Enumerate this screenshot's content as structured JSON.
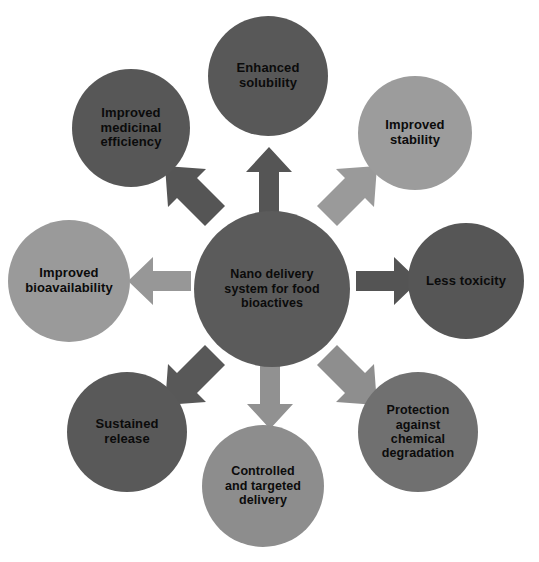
{
  "diagram": {
    "type": "radial-hub-and-spoke",
    "background_color": "#ffffff",
    "palette": {
      "dark_gray": "#5b5b5b",
      "mid_dark_gray": "#606060",
      "light_gray": "#9b9b9b",
      "text_color": "#0b0b0b"
    },
    "center": {
      "label": "Nano delivery\nsystem for food\nbioactives",
      "color": "#5b5b5b",
      "font_size": "12.5px",
      "cx": 272,
      "cy": 289,
      "r": 78
    },
    "nodes": [
      {
        "id": "enhanced-solubility",
        "label": "Enhanced\nsolubility",
        "color": "#585858",
        "cx": 268,
        "cy": 76,
        "r": 60,
        "font_size": "13px",
        "position": "top"
      },
      {
        "id": "improved-stability",
        "label": "Improved\nstability",
        "color": "#9c9c9c",
        "cx": 415,
        "cy": 133,
        "r": 57,
        "font_size": "13px",
        "position": "top-right"
      },
      {
        "id": "less-toxicity",
        "label": "Less toxicity",
        "color": "#565656",
        "cx": 466,
        "cy": 281,
        "r": 58,
        "font_size": "13px",
        "position": "right"
      },
      {
        "id": "protection-against-chemical-degradation",
        "label": "Protection\nagainst\nchemical\ndegradation",
        "color": "#707070",
        "cx": 418,
        "cy": 432,
        "r": 60,
        "font_size": "12.5px",
        "position": "bottom-right"
      },
      {
        "id": "controlled-and-targeted-delivery",
        "label": "Controlled\nand targeted\ndelivery",
        "color": "#8d8d8d",
        "cx": 263,
        "cy": 486,
        "r": 61,
        "font_size": "12.5px",
        "position": "bottom"
      },
      {
        "id": "sustained-release",
        "label": "Sustained\nrelease",
        "color": "#595959",
        "cx": 127,
        "cy": 432,
        "r": 60,
        "font_size": "13px",
        "position": "bottom-left"
      },
      {
        "id": "improved-bioavailability",
        "label": "Improved\nbioavailability",
        "color": "#9a9a9a",
        "cx": 69,
        "cy": 281,
        "r": 61,
        "font_size": "13px",
        "position": "left"
      },
      {
        "id": "improved-medicinal-efficiency",
        "label": "Improved\nmedicinal\nefficiency",
        "color": "#575757",
        "cx": 131,
        "cy": 128,
        "r": 59,
        "font_size": "13px",
        "position": "top-left"
      }
    ],
    "arrows": [
      {
        "id": "arrow-up",
        "target": "enhanced-solubility",
        "direction": "up",
        "color": "#555555"
      },
      {
        "id": "arrow-up-right",
        "target": "improved-stability",
        "direction": "up-right",
        "color": "#9a9a9a"
      },
      {
        "id": "arrow-right",
        "target": "less-toxicity",
        "direction": "right",
        "color": "#545454"
      },
      {
        "id": "arrow-down-right",
        "target": "protection-against-chemical-degradation",
        "direction": "down-right",
        "color": "#8e8e8e"
      },
      {
        "id": "arrow-down",
        "target": "controlled-and-targeted-delivery",
        "direction": "down",
        "color": "#919191"
      },
      {
        "id": "arrow-down-left",
        "target": "sustained-release",
        "direction": "down-left",
        "color": "#585858"
      },
      {
        "id": "arrow-left",
        "target": "improved-bioavailability",
        "direction": "left",
        "color": "#979797"
      },
      {
        "id": "arrow-up-left",
        "target": "improved-medicinal-efficiency",
        "direction": "up-left",
        "color": "#555555"
      }
    ]
  }
}
